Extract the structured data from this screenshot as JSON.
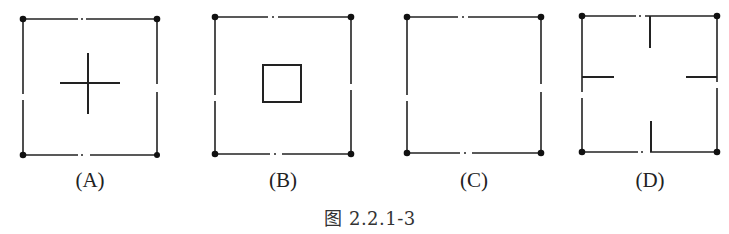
{
  "figure": {
    "caption": "图 2.2.1-3",
    "line_color": "#222222",
    "panels": [
      {
        "label": "(A)",
        "description": "square with corner dots and center cross"
      },
      {
        "label": "(B)",
        "description": "square with corner dots and small center square"
      },
      {
        "label": "(C)",
        "description": "empty square with corner dots"
      },
      {
        "label": "(D)",
        "description": "square with corner dots and four inward ticks from edge midpoints"
      }
    ]
  }
}
